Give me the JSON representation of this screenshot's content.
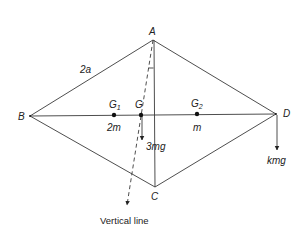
{
  "diagram": {
    "points": {
      "A": {
        "label": "A",
        "x": 153,
        "y": 40
      },
      "B": {
        "label": "B",
        "x": 30,
        "y": 116
      },
      "C": {
        "label": "C",
        "x": 155,
        "y": 187
      },
      "D": {
        "label": "D",
        "x": 276,
        "y": 114
      },
      "G1": {
        "label": "G",
        "sub": "1",
        "x": 114,
        "y": 115
      },
      "G": {
        "label": "G",
        "x": 141,
        "y": 115
      },
      "G2": {
        "label": "G",
        "sub": "2",
        "x": 197,
        "y": 114
      }
    },
    "labels": {
      "side_AB": "2a",
      "mass_G1": "2m",
      "mass_G2": "m",
      "force_G": "3mg",
      "force_D": "kmg",
      "vertical_line": "Vertical line"
    },
    "colors": {
      "line": "#3a3a3a",
      "text": "#222222",
      "background": "#ffffff"
    }
  }
}
